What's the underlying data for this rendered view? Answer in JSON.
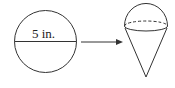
{
  "diagram": {
    "circle": {
      "label": "5 in.",
      "description": "circle with diameter"
    },
    "arrow": {
      "direction": "right"
    },
    "cone": {
      "description": "cone topped with hemisphere"
    },
    "stroke_color": "#333333"
  }
}
